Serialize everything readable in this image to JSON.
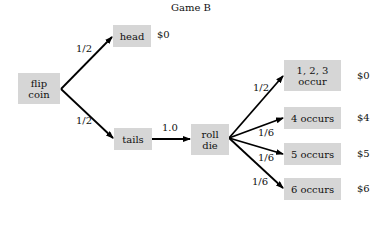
{
  "title": "Game B",
  "nodes": {
    "flip": {
      "line1": "flip",
      "line2": "coin"
    },
    "head": {
      "label": "head",
      "payoff": "$0"
    },
    "tails": {
      "label": "tails"
    },
    "roll": {
      "line1": "roll",
      "line2": "die"
    },
    "o123": {
      "line1": "1, 2, 3",
      "line2": "occur",
      "payoff": "$0"
    },
    "o4": {
      "label": "4 occurs",
      "payoff": "$4"
    },
    "o5": {
      "label": "5 occurs",
      "payoff": "$5"
    },
    "o6": {
      "label": "6 occurs",
      "payoff": "$6"
    }
  },
  "edges": {
    "flip_head": "1/2",
    "flip_tails": "1/2",
    "tails_roll": "1.0",
    "roll_123": "1/2",
    "roll_4": "1/6",
    "roll_5": "1/6",
    "roll_6": "1/6"
  },
  "colors": {
    "box_fill": "#d6d6d6",
    "edge": "#000000"
  }
}
